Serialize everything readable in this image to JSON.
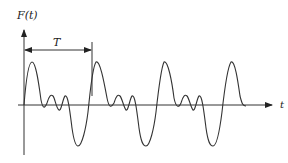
{
  "figure": {
    "y_axis_label": "F(t)",
    "x_axis_label": "t",
    "period_label": "T"
  },
  "colors": {
    "stroke": "#333333",
    "background": "#ffffff"
  },
  "geometry": {
    "origin_x": 24,
    "baseline_y": 105,
    "period_px": 68,
    "cycles_shown": 3.4
  }
}
